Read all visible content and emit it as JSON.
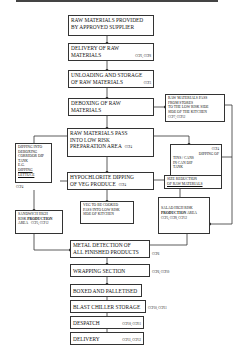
{
  "diagram": {
    "type": "flowchart",
    "nodes": {
      "n1": {
        "line1": "RAW MATERIALS PROVIDED",
        "line2": "BY APPROVED SUPPLIER"
      },
      "n2": {
        "line1": "DELIVERY OF RAW",
        "line2": "MATERIALS",
        "ccp": "CCP1, CCP8"
      },
      "n3": {
        "line1": "UNLOADING AND STORAGE",
        "line2": "OF RAW MATERIALS",
        "ccp": "CCP3"
      },
      "n4": {
        "line1": "DEBOXING OF RAW",
        "line2": "MATERIALS"
      },
      "n5": {
        "line1": "RAW MATERIALS PASS",
        "line2": "FROM STORES",
        "line3": "TO THE LOW RISK SIDE",
        "line4": "SIDE OF THE KITCHEN",
        "ccp": "CCP7, CCP12"
      },
      "n6": {
        "line1": "RAW MATERIALS PASS",
        "line2": "INTO LOW RISK",
        "line3": "PREPARATION AREA",
        "ccp": "CCP4"
      },
      "n7": {
        "ccp": "CCP4",
        "line1": "DIPPING OF",
        "line2": "TINS / CANS",
        "line3": "IN CAN DIP",
        "line4": "TANK"
      },
      "n8": {
        "line1": "DIPPING INTO",
        "line2": "DEBOXING",
        "line3": "CORRIDOR DIP",
        "line4": "TANK",
        "line5": "E.G.",
        "line6": "DIPPING LETTUCE",
        "ccp": "CCP4"
      },
      "n9": {
        "line1": "HYPOCHLORITE DIPPING",
        "line2": "OF VEG PRODUCE",
        "ccp": "CCP4"
      },
      "n10": {
        "line1": "SIZE REDUCTION",
        "line2": "OF RAW MATERIALS"
      },
      "n11": {
        "line1": "SANDWICH HIGH",
        "line2a": "RISK ",
        "line2b": "PRODUCTION",
        "line3": "AREA",
        "ccp": "CCP5, CCP12"
      },
      "n12": {
        "line1": "VEG TO BE COOKED",
        "line2": "PASS INTO LOW RISK",
        "line3": "SIDE OF KITCHEN"
      },
      "n13": {
        "line1": "SALAD HIGH RISK",
        "line2a": "PRODUCTION",
        "line2b": " AREA",
        "line3": "CCP5, CCP8, CCP12"
      },
      "n14": {
        "line1": "METAL DETECTION OF",
        "line2": "ALL FINISHED PRODUCTS",
        "ccp": "CCP6"
      },
      "n15": {
        "line1": "WRAPPING SECTION",
        "ccp": "CCP6, CCP10"
      },
      "n16": {
        "line1": "BOXED AND PALLETISED"
      },
      "n17": {
        "line1": "BLAST CHILLER STORAGE",
        "ccp": "CCP10, CCP11"
      },
      "n18": {
        "line1": "DESPATCH",
        "ccp": "CCP10, CCP11"
      },
      "n19": {
        "line1": "DELIVERY",
        "ccp": "CCP11, CCP12"
      }
    }
  }
}
